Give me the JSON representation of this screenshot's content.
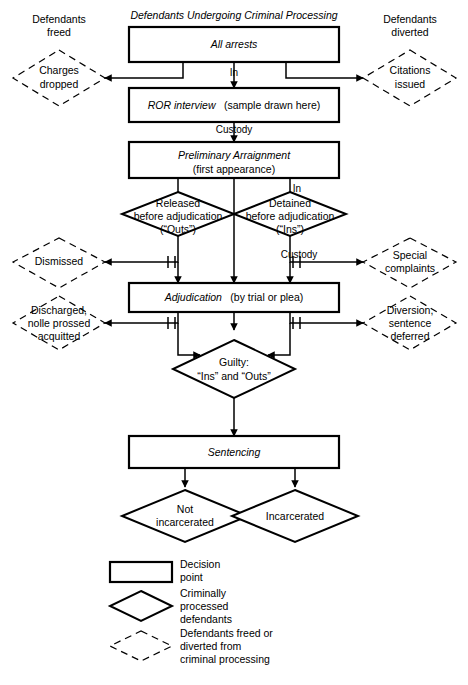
{
  "diagram": {
    "title": "Defendants Undergoing Criminal Processing",
    "left_caption_top": {
      "line1": "Defendants",
      "line2": "freed"
    },
    "right_caption_top": {
      "line1": "Defendants",
      "line2": "diverted"
    }
  },
  "nodes": {
    "all_arrests": {
      "label_italic": "All arrests",
      "shape": "box"
    },
    "ror_interview": {
      "label_italic": "ROR interview",
      "label_plain": "(sample drawn here)",
      "shape": "box"
    },
    "preliminary_arraignment": {
      "label_italic": "Preliminary Arraignment",
      "label_plain": "(first appearance)",
      "shape": "box"
    },
    "adjudication": {
      "label_italic": "Adjudication",
      "label_plain": "(by trial or plea)",
      "shape": "box"
    },
    "sentencing": {
      "label_italic": "Sentencing",
      "shape": "box"
    },
    "released_before_adjudication": {
      "line1": "Released",
      "line2": "before adjudication",
      "line3": "(“Outs”)",
      "shape": "diamond"
    },
    "detained_before_adjudication": {
      "line1": "Detained",
      "line2": "before adjudication",
      "line3": "(“Ins”)",
      "shape": "diamond"
    },
    "guilty": {
      "line1": "Guilty:",
      "line2": "“Ins” and “Outs”",
      "shape": "diamond"
    },
    "not_incarcerated": {
      "line1": "Not",
      "line2": "incarcerated",
      "shape": "diamond"
    },
    "incarcerated": {
      "line1": "Incarcerated",
      "shape": "diamond"
    },
    "charges_dropped": {
      "line1": "Charges",
      "line2": "dropped",
      "shape": "diamond-dashed"
    },
    "citations_issued": {
      "line1": "Citations",
      "line2": "issued",
      "shape": "diamond-dashed"
    },
    "dismissed": {
      "line1": "Dismissed",
      "shape": "diamond-dashed"
    },
    "special_complaints": {
      "line1": "Special",
      "line2": "complaints",
      "shape": "diamond-dashed"
    },
    "discharged": {
      "line1": "Discharged,",
      "line2": "nolle prossed",
      "line3": "acquitted",
      "shape": "diamond-dashed"
    },
    "diversion": {
      "line1": "Diversion,",
      "line2": "sentence",
      "line3": "deferred",
      "shape": "diamond-dashed"
    }
  },
  "edge_labels": {
    "in_after_arrest": "In",
    "custody_after_ror": "Custody",
    "in_after_arraignment": "In",
    "custody_after_detained": "Custody"
  },
  "legend": {
    "items": [
      {
        "swatch": "box",
        "line1": "Decision",
        "line2": "point",
        "line3": ""
      },
      {
        "swatch": "diamond",
        "line1": "Criminally",
        "line2": "processed",
        "line3": "defendants"
      },
      {
        "swatch": "diamond-dashed",
        "line1": "Defendants freed or",
        "line2": "diverted from",
        "line3": "criminal processing"
      }
    ]
  },
  "colors": {
    "ink": "#000000",
    "paper": "#ffffff"
  }
}
